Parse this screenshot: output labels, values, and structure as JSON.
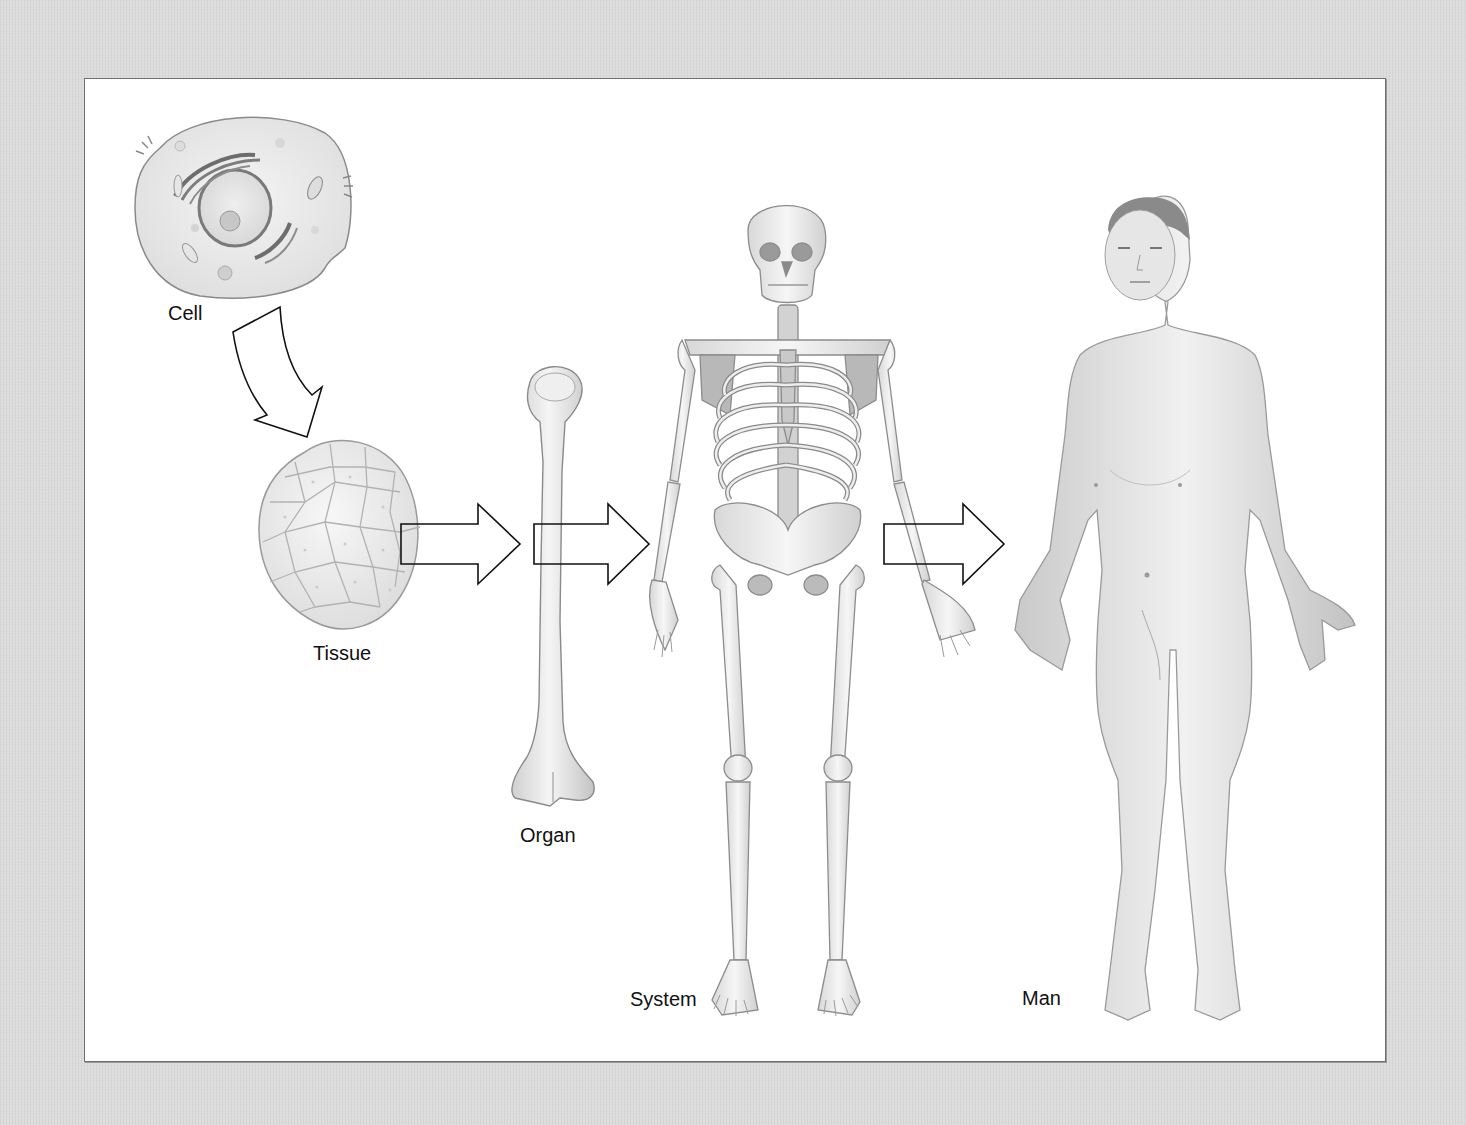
{
  "diagram": {
    "stages": [
      {
        "id": "cell",
        "label": "Cell",
        "icon": "cell-icon"
      },
      {
        "id": "tissue",
        "label": "Tissue",
        "icon": "tissue-icon"
      },
      {
        "id": "organ",
        "label": "Organ",
        "icon": "bone-icon"
      },
      {
        "id": "system",
        "label": "System",
        "icon": "skeleton-icon"
      },
      {
        "id": "man",
        "label": "Man",
        "icon": "human-body-icon"
      }
    ],
    "arrows": [
      {
        "from": "cell",
        "to": "tissue",
        "style": "curved-outline"
      },
      {
        "from": "tissue",
        "to": "organ",
        "style": "block-outline"
      },
      {
        "from": "organ",
        "to": "system",
        "style": "block-outline"
      },
      {
        "from": "system",
        "to": "man",
        "style": "block-outline"
      }
    ],
    "colors": {
      "background": "#dcdcdc",
      "panel": "#ffffff",
      "border": "#6e6e6e",
      "ink": "#111111",
      "illustration_fill": "#ececec",
      "illustration_stroke": "#8a8a8a"
    }
  }
}
